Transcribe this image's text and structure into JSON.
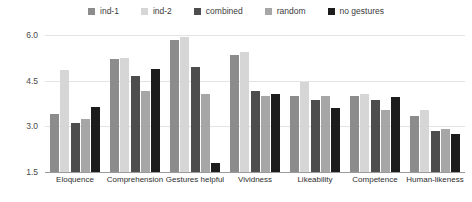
{
  "chart_data": {
    "type": "bar",
    "title": "",
    "xlabel": "",
    "ylabel": "",
    "ylim": [
      1.5,
      6.0
    ],
    "yticks": [
      "1.5",
      "3.0",
      "4.5",
      "6.0"
    ],
    "ytick_values": [
      1.5,
      3.0,
      4.5,
      6.0
    ],
    "grid": true,
    "legend_position": "top-center",
    "categories": [
      "Eloquence",
      "Comprehension",
      "Gestures helpful",
      "Vividness",
      "Likeability",
      "Competence",
      "Human-likeness"
    ],
    "series": [
      {
        "name": "ind-1",
        "color": "#8c8c8c",
        "values": [
          3.4,
          5.2,
          5.85,
          5.35,
          4.0,
          4.0,
          3.35
        ]
      },
      {
        "name": "ind-2",
        "color": "#d6d6d6",
        "values": [
          4.85,
          5.25,
          5.95,
          5.45,
          4.45,
          4.05,
          3.55
        ]
      },
      {
        "name": "combined",
        "color": "#4d4d4d",
        "values": [
          3.1,
          4.65,
          4.95,
          4.15,
          3.85,
          3.85,
          2.85
        ]
      },
      {
        "name": "random",
        "color": "#a6a6a6",
        "values": [
          3.25,
          4.15,
          4.05,
          4.0,
          4.0,
          3.55,
          2.9
        ]
      },
      {
        "name": "no gestures",
        "color": "#1c1c1c",
        "values": [
          3.65,
          4.9,
          1.8,
          4.05,
          3.6,
          3.95,
          2.75
        ]
      }
    ]
  },
  "legend": {
    "items": [
      {
        "label": "ind-1",
        "swatch": "#8c8c8c"
      },
      {
        "label": "ind-2",
        "swatch": "#d6d6d6"
      },
      {
        "label": "combined",
        "swatch": "#4d4d4d"
      },
      {
        "label": "random",
        "swatch": "#a6a6a6"
      },
      {
        "label": "no gestures",
        "swatch": "#1c1c1c"
      }
    ]
  },
  "colors": {
    "gridline": "#e3e3e3",
    "axis": "#9a9a9a",
    "tick_text": "#4a4a4a",
    "label_text": "#2e2e2e",
    "background": "#ffffff"
  }
}
